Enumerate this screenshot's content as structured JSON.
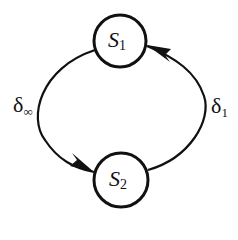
{
  "diagram": {
    "states": [
      {
        "id": "S1",
        "name": "S",
        "subscript": "1"
      },
      {
        "id": "S2",
        "name": "S",
        "subscript": "2"
      }
    ],
    "transitions": [
      {
        "from": "S1",
        "to": "S2",
        "symbol": "δ",
        "subscript": "∞",
        "side": "left"
      },
      {
        "from": "S2",
        "to": "S1",
        "symbol": "δ",
        "subscript": "1",
        "side": "right"
      }
    ],
    "colors": {
      "stroke": "#111111",
      "background": "#ffffff"
    }
  }
}
